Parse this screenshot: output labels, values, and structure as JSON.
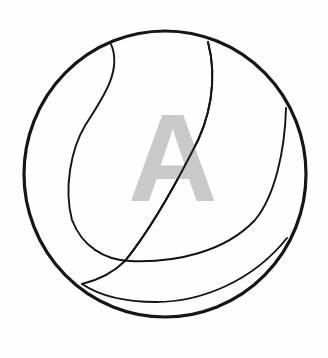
{
  "figure": {
    "letter": "A",
    "colors": {
      "background": "#fefefe",
      "outline": "#161616",
      "seams": "#141414",
      "letter": "#c9c9c9"
    },
    "icon": "ball-icon"
  }
}
